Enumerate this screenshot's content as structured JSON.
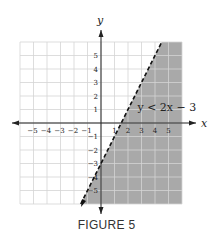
{
  "caption": "FIGURE 5",
  "chart_data": {
    "type": "line",
    "title": "",
    "caption": "FIGURE 5",
    "xlabel": "x",
    "ylabel": "y",
    "xlim": [
      -6,
      6
    ],
    "ylim": [
      -6,
      6
    ],
    "grid": true,
    "x_ticks": [
      -5,
      -4,
      -3,
      -2,
      -1,
      1,
      2,
      3,
      4,
      5
    ],
    "y_ticks": [
      -5,
      -4,
      -3,
      -2,
      -1,
      1,
      2,
      3,
      4,
      5
    ],
    "series": [
      {
        "name": "y = 2x - 3 (boundary)",
        "style": "dashed",
        "x": [
          -1.5,
          4.5
        ],
        "y": [
          -6,
          6
        ]
      }
    ],
    "shaded_region": "y < 2x - 3 (below/right of line)",
    "annotations": [
      {
        "text": "y < 2x − 3",
        "x": 2.7,
        "y": 1.2
      }
    ],
    "colors": {
      "shade": "#a9a9a9",
      "grid": "#d4d4d4",
      "axis": "#222222"
    }
  }
}
